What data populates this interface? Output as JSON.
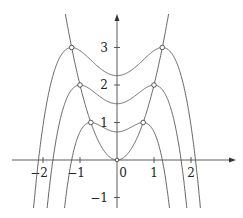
{
  "chart_data": {
    "type": "line",
    "title": "",
    "xlabel": "",
    "ylabel": "",
    "xlim": [
      -2.5,
      2.6
    ],
    "ylim": [
      -1.3,
      3.7
    ],
    "grid": false,
    "x_ticks": [
      -2,
      -1,
      0,
      1,
      2
    ],
    "x_tick_labels": [
      "−2",
      "−1",
      "0",
      "1",
      "2"
    ],
    "y_ticks": [
      -1,
      1,
      2,
      3
    ],
    "y_tick_labels": [
      "−1",
      "1",
      "2",
      "3"
    ],
    "series": [
      {
        "name": "y = 2x^2",
        "formula": "2*x^2"
      },
      {
        "name": "c = 1",
        "formula": "1 - (x^2 - 0.5)^2 / 1"
      },
      {
        "name": "c = 2",
        "formula": "2 - (x^2 - 1)^2 / 2"
      },
      {
        "name": "c = 3",
        "formula": "3 - (x^2 - 1.5)^2 / 3"
      }
    ],
    "marked_points": [
      [
        -0.707,
        1
      ],
      [
        0.707,
        1
      ],
      [
        -1,
        2
      ],
      [
        1,
        2
      ],
      [
        -1.225,
        3
      ],
      [
        1.225,
        3
      ]
    ],
    "line_color": "#555555"
  }
}
